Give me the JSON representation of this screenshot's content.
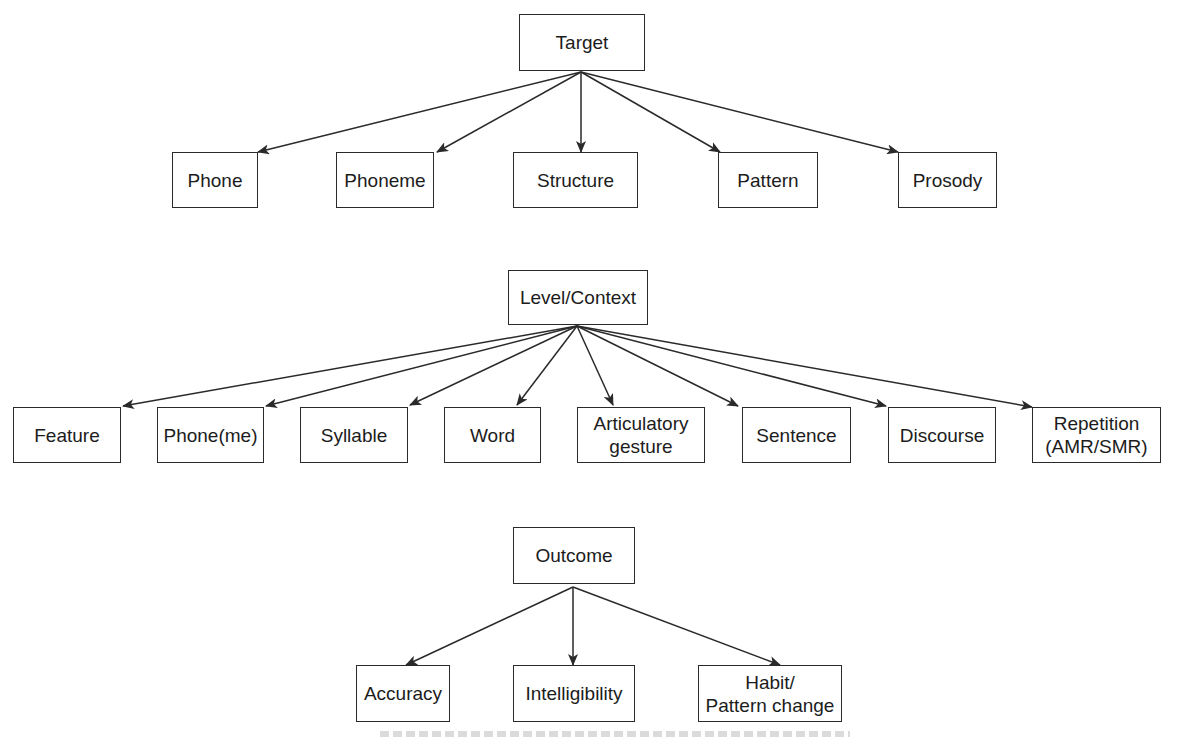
{
  "diagram": {
    "type": "hierarchy",
    "groups": [
      {
        "root": {
          "id": "target",
          "label": "Target",
          "box": [
            519,
            14,
            126,
            57
          ],
          "origin": [
            581,
            72
          ]
        },
        "children": [
          {
            "id": "phone",
            "label": "Phone",
            "box": [
              172,
              152,
              86,
              56
            ],
            "tip": [
              258,
              152
            ]
          },
          {
            "id": "phoneme",
            "label": "Phoneme",
            "box": [
              336,
              152,
              98,
              56
            ],
            "tip": [
              437,
              152
            ]
          },
          {
            "id": "structure",
            "label": "Structure",
            "box": [
              513,
              152,
              125,
              56
            ],
            "tip": [
              581,
              152
            ]
          },
          {
            "id": "pattern",
            "label": "Pattern",
            "box": [
              718,
              152,
              100,
              56
            ],
            "tip": [
              720,
              152
            ]
          },
          {
            "id": "prosody",
            "label": "Prosody",
            "box": [
              898,
              152,
              99,
              56
            ],
            "tip": [
              898,
              152
            ]
          }
        ]
      },
      {
        "root": {
          "id": "level-context",
          "label": "Level/Context",
          "box": [
            508,
            270,
            140,
            55
          ],
          "origin": [
            577,
            326
          ]
        },
        "children": [
          {
            "id": "feature",
            "label": "Feature",
            "box": [
              13,
              407,
              108,
              56
            ],
            "tip": [
              123,
              406
            ]
          },
          {
            "id": "phoneme-paren",
            "label": "Phone(me)",
            "box": [
              157,
              407,
              107,
              56
            ],
            "tip": [
              266,
              406
            ]
          },
          {
            "id": "syllable",
            "label": "Syllable",
            "box": [
              300,
              407,
              108,
              56
            ],
            "tip": [
              410,
              405
            ]
          },
          {
            "id": "word",
            "label": "Word",
            "box": [
              444,
              407,
              97,
              56
            ],
            "tip": [
              517,
              405
            ]
          },
          {
            "id": "articulatory-gesture",
            "label": "Articulatory\ngesture",
            "box": [
              577,
              407,
              128,
              56
            ],
            "tip": [
              613,
              405
            ]
          },
          {
            "id": "sentence",
            "label": "Sentence",
            "box": [
              742,
              407,
              109,
              56
            ],
            "tip": [
              738,
              406
            ]
          },
          {
            "id": "discourse",
            "label": "Discourse",
            "box": [
              888,
              407,
              108,
              56
            ],
            "tip": [
              886,
              406
            ]
          },
          {
            "id": "repetition",
            "label": "Repetition\n(AMR/SMR)",
            "box": [
              1032,
              407,
              129,
              56
            ],
            "tip": [
              1032,
              407
            ]
          }
        ]
      },
      {
        "root": {
          "id": "outcome",
          "label": "Outcome",
          "box": [
            513,
            527,
            122,
            57
          ],
          "origin": [
            573,
            587
          ]
        },
        "children": [
          {
            "id": "accuracy",
            "label": "Accuracy",
            "box": [
              356,
              665,
              94,
              57
            ],
            "tip": [
              406,
              665
            ]
          },
          {
            "id": "intelligibility",
            "label": "Intelligibility",
            "box": [
              513,
              665,
              122,
              57
            ],
            "tip": [
              573,
              665
            ]
          },
          {
            "id": "habit-pattern-change",
            "label": "Habit/\nPattern change",
            "box": [
              698,
              665,
              144,
              57
            ],
            "tip": [
              780,
              665
            ]
          }
        ]
      }
    ],
    "colors": {
      "line": "#2a2a2a",
      "box_border": "#2a2a2a",
      "text": "#1c1c1c",
      "background": "#ffffff"
    }
  }
}
